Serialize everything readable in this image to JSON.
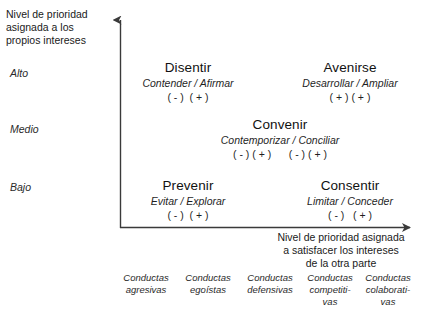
{
  "axes": {
    "y_title": "Nivel de prioridad\nasignada a los\npropios intereses",
    "x_title": "Nivel de prioridad asignada\na satisfacer los intereses\nde la otra parte",
    "y_ticks": [
      {
        "label": "Alto"
      },
      {
        "label": "Medio"
      },
      {
        "label": "Bajo"
      }
    ]
  },
  "cells": [
    {
      "id": "disentir",
      "name": "Disentir",
      "subtitle": "Contender / Afirmar",
      "signs": "( - )  ( + )"
    },
    {
      "id": "avenirse",
      "name": "Avenirse",
      "subtitle": "Desarrollar / Ampliar",
      "signs": "( + ) ( + )"
    },
    {
      "id": "convenir",
      "name": "Convenir",
      "subtitle": "Contemporizar / Conciliar",
      "signs": "( - ) ( + )      ( - ) ( + )"
    },
    {
      "id": "prevenir",
      "name": "Prevenir",
      "subtitle": "Evitar / Explorar",
      "signs": "( - )  ( + )"
    },
    {
      "id": "consentir",
      "name": "Consentir",
      "subtitle": "Limitar / Conceder",
      "signs": "( - )   ( + )"
    }
  ],
  "columns": [
    {
      "label": "Conductas\nagresivas"
    },
    {
      "label": "Conductas\negoístas"
    },
    {
      "label": "Conductas\ndefensivas"
    },
    {
      "label": "Conductas\ncompetiti-\nvas"
    },
    {
      "label": "Conductas\ncolaborati-\nvas"
    }
  ],
  "colors": {
    "axis": "#3a3a3a",
    "text": "#1a1a1a",
    "background": "#ffffff"
  }
}
